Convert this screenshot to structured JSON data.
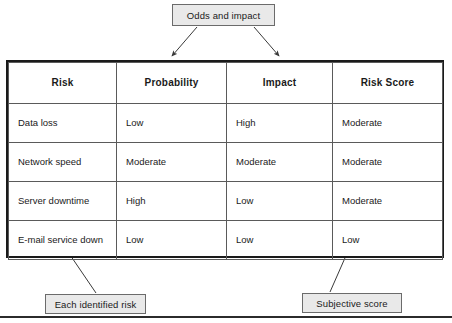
{
  "diagram": {
    "title_annotation": "Odds and impact",
    "bottom_left_annotation": "Each identified risk",
    "bottom_right_annotation": "Subjective score"
  },
  "table": {
    "columns": [
      "Risk",
      "Probability",
      "Impact",
      "Risk Score"
    ],
    "rows": [
      {
        "risk": "Data loss",
        "probability": "Low",
        "impact": "High",
        "risk_score": "Moderate"
      },
      {
        "risk": "Network speed",
        "probability": "Moderate",
        "impact": "Moderate",
        "risk_score": "Moderate"
      },
      {
        "risk": "Server downtime",
        "probability": "High",
        "impact": "Low",
        "risk_score": "Moderate"
      },
      {
        "risk": "E-mail service down",
        "probability": "Low",
        "impact": "Low",
        "risk_score": "Low"
      }
    ]
  },
  "connectors": [
    {
      "name": "arrow-odds-to-probability",
      "from": "Odds and impact",
      "to": "Probability column"
    },
    {
      "name": "arrow-odds-to-impact",
      "from": "Odds and impact",
      "to": "Impact column"
    },
    {
      "name": "arrow-each-risk-to-risk-column",
      "from": "Each identified risk",
      "to": "Risk column"
    },
    {
      "name": "arrow-subjective-to-risk-score",
      "from": "Subjective score",
      "to": "Risk Score column"
    }
  ],
  "colors": {
    "callout_fill": "#e9e9e9",
    "callout_border": "#6b6b6b",
    "table_outer_border": "#1a1a1a",
    "table_inner_border": "#5a5a5a",
    "text": "#1a1a1a",
    "rule": "#2b2b2b"
  }
}
